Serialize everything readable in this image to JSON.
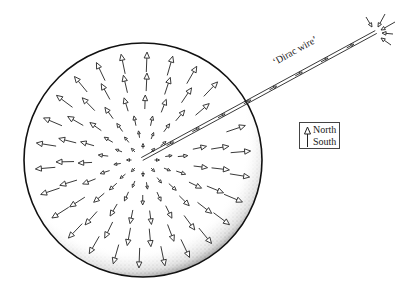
{
  "diagram": {
    "sphere": {
      "cx": 143,
      "cy": 160,
      "rx": 119,
      "ry": 117,
      "stroke": "#111111",
      "stipple": "#333333"
    },
    "wire": {
      "label": "‘Dirac wire’",
      "start": [
        142,
        159
      ],
      "end": [
        376,
        32
      ],
      "stroke": "#222222"
    },
    "field_arrows": {
      "direction": "radially-outward",
      "rings": [
        {
          "radius": 14,
          "count": 8,
          "length": 5
        },
        {
          "radius": 26,
          "count": 12,
          "length": 7
        },
        {
          "radius": 40,
          "count": 15,
          "length": 10
        },
        {
          "radius": 58,
          "count": 19,
          "length": 14
        },
        {
          "radius": 78,
          "count": 23,
          "length": 18
        },
        {
          "radius": 98,
          "count": 26,
          "length": 20
        }
      ]
    },
    "end_arrows": {
      "direction": "inward-to-wire-end",
      "items": [
        {
          "from": [
            366,
            17
          ],
          "to": [
            372,
            27
          ]
        },
        {
          "from": [
            385,
            14
          ],
          "to": [
            378,
            27
          ]
        },
        {
          "from": [
            395,
            22
          ],
          "to": [
            381,
            30
          ]
        },
        {
          "from": [
            393,
            34
          ],
          "to": [
            382,
            33
          ]
        },
        {
          "from": [
            391,
            45
          ],
          "to": [
            381,
            38
          ]
        }
      ]
    },
    "legend": {
      "north_label": "North",
      "south_label": "South",
      "symbol": "arrow-head = north pole, tail = south pole"
    }
  }
}
